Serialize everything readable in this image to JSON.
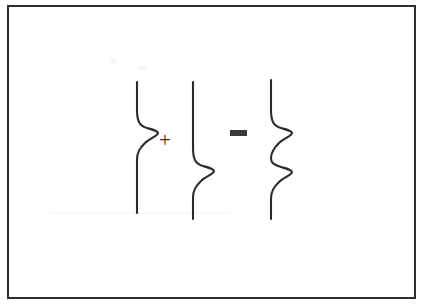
{
  "figure": {
    "background_color": "#ffffff",
    "ink_color": "#2b2b2b",
    "frame_color": "#2e2e2e"
  },
  "operators": {
    "plus": "+",
    "equals": "="
  },
  "chart_data": {
    "type": "line",
    "title": "",
    "xlabel": "",
    "ylabel": "",
    "grid": false,
    "legend": null,
    "orientation": "vertical",
    "note": "Transverse pulse superposition: pulse A (displacement near top) + pulse B (displacement near bottom) = combined waveform carrying both displacements",
    "series": [
      {
        "name": "pulse-a",
        "role": "first addend",
        "baseline_x": 137,
        "y_start": 82,
        "y_end": 213,
        "bumps": [
          {
            "center_y": 130,
            "amplitude_x": 22,
            "direction": "right"
          }
        ],
        "path": "M137,82 L137,110 C137,122 140,126 147,128 C154,130 158,131 158,133 C158,136 150,138 145,143 C140,148 137,152 137,160 L137,213"
      },
      {
        "name": "pulse-b",
        "role": "second addend",
        "baseline_x": 193,
        "y_start": 82,
        "y_end": 219,
        "bumps": [
          {
            "center_y": 168,
            "amplitude_x": 22,
            "direction": "right"
          }
        ],
        "path": "M193,82 L193,148 C193,160 196,164 203,166 C210,168 214,169 214,171 C214,174 206,176 201,181 C196,186 193,190 193,198 L193,219"
      },
      {
        "name": "pulse-sum",
        "role": "result",
        "baseline_x": 271,
        "y_start": 80,
        "y_end": 219,
        "bumps": [
          {
            "center_y": 130,
            "amplitude_x": 22,
            "direction": "right"
          },
          {
            "center_y": 168,
            "amplitude_x": 22,
            "direction": "right"
          }
        ],
        "path": "M271,80 L271,110 C271,122 274,126 281,128 C288,130 292,131 292,133 C292,136 284,138 279,143 C274,148 271,152 271,158 C271,163 274,165 281,167 C288,169 292,170 292,172 C292,175 284,177 279,182 C274,187 271,191 271,199 L271,219"
      }
    ]
  }
}
